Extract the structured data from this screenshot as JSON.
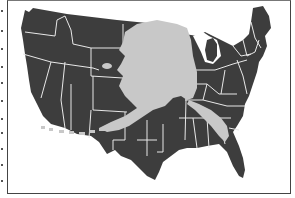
{
  "map": {
    "title": "Alaska superimposed on the contiguous United States",
    "subject": "size comparison",
    "layers": [
      {
        "name": "contiguous-us",
        "description": "Lower 48 states with state borders",
        "color": "#3d3d3d"
      },
      {
        "name": "alaska-overlay",
        "description": "Alaska outline including panhandle and Aleutian chain",
        "color": "#c8c8c8"
      }
    ],
    "colors": {
      "land": "#3d3d3d",
      "borders": "#e8e8e8",
      "overlay": "#c8c8c8",
      "background": "#ffffff",
      "frame": "#444444"
    }
  }
}
